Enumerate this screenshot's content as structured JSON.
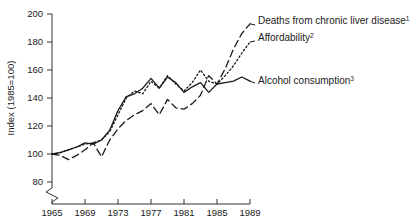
{
  "chart_data": {
    "type": "line",
    "title": "",
    "xlabel": "",
    "ylabel": "Index (1985=100)",
    "xlim": [
      1965,
      1989
    ],
    "ylim": [
      80,
      200
    ],
    "grid": false,
    "legend_position": "right-inline-labels",
    "y_axis_break": true,
    "xticks": [
      "1965",
      "1969",
      "1973",
      "1977",
      "1981",
      "1985",
      "1989"
    ],
    "xtick_values": [
      1965,
      1969,
      1973,
      1977,
      1981,
      1985,
      1989
    ],
    "yticks": [
      "80",
      "100",
      "120",
      "140",
      "160",
      "180",
      "200"
    ],
    "ytick_values": [
      80,
      100,
      120,
      140,
      160,
      180,
      200
    ],
    "x": [
      1965,
      1966,
      1967,
      1968,
      1969,
      1970,
      1971,
      1972,
      1973,
      1974,
      1975,
      1976,
      1977,
      1978,
      1979,
      1980,
      1981,
      1982,
      1983,
      1984,
      1985,
      1986,
      1987,
      1988,
      1989
    ],
    "series": [
      {
        "name": "Deaths from chronic liver disease",
        "footnote": "1",
        "label": "Deaths from chronic liver disease",
        "style": "dashed",
        "dash_pattern": "7,4",
        "color": "#1a1a1a",
        "values": [
          100,
          99,
          96,
          99,
          103,
          108,
          98,
          110,
          118,
          124,
          128,
          131,
          136,
          128,
          139,
          133,
          132,
          136,
          142,
          156,
          150,
          161,
          175,
          186,
          193
        ]
      },
      {
        "name": "Affordability",
        "footnote": "2",
        "label": "Affordability",
        "style": "dotted",
        "dash_pattern": "1.6,2.4",
        "color": "#1a1a1a",
        "values": [
          100,
          101,
          103,
          105,
          107,
          108,
          110,
          116,
          128,
          140,
          145,
          143,
          152,
          147,
          156,
          150,
          145,
          151,
          160,
          152,
          150,
          156,
          163,
          172,
          180
        ]
      },
      {
        "name": "Alcohol consumption",
        "footnote": "3",
        "label": "Alcohol consumption",
        "style": "solid",
        "dash_pattern": "none",
        "color": "#1a1a1a",
        "values": [
          100,
          101,
          103,
          105,
          108,
          107,
          110,
          117,
          131,
          141,
          143,
          147,
          154,
          147,
          155,
          151,
          144,
          148,
          151,
          144,
          150,
          151,
          152,
          155,
          152
        ]
      }
    ]
  },
  "axis": {
    "y_title": "Index (1985=100)"
  }
}
